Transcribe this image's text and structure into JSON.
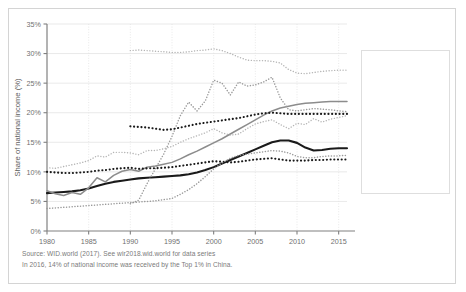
{
  "chart_data": {
    "type": "line",
    "title": "",
    "xlabel": "",
    "ylabel": "Share of national income (%)",
    "xlim": [
      1980,
      2016
    ],
    "ylim": [
      0,
      35
    ],
    "grid": true,
    "legend_position": "right",
    "xticks": [
      "1980",
      "1985",
      "1990",
      "1995",
      "2000",
      "2005",
      "2010",
      "2015"
    ],
    "xtick_values": [
      1980,
      1985,
      1990,
      1995,
      2000,
      2005,
      2010,
      2015
    ],
    "yticks": [
      "0%",
      "5%",
      "10%",
      "15%",
      "20%",
      "25%",
      "30%",
      "35%"
    ],
    "ytick_values": [
      0,
      5,
      10,
      15,
      20,
      25,
      30,
      35
    ],
    "series": [
      {
        "name": "China",
        "style": "solid",
        "color": "#1a1a1a",
        "width": 2.1,
        "x": [
          1980,
          1981,
          1982,
          1983,
          1984,
          1985,
          1986,
          1987,
          1988,
          1989,
          1990,
          1991,
          1992,
          1993,
          1994,
          1995,
          1996,
          1997,
          1998,
          1999,
          2000,
          2001,
          2002,
          2003,
          2004,
          2005,
          2006,
          2007,
          2008,
          2009,
          2010,
          2011,
          2012,
          2013,
          2014,
          2015,
          2016
        ],
        "values": [
          6.4,
          6.5,
          6.6,
          6.7,
          6.9,
          7.2,
          7.6,
          8.0,
          8.3,
          8.5,
          8.7,
          8.9,
          9.0,
          9.1,
          9.2,
          9.3,
          9.4,
          9.6,
          9.9,
          10.3,
          10.8,
          11.4,
          12.0,
          12.6,
          13.2,
          13.8,
          14.4,
          15.0,
          15.3,
          15.3,
          14.9,
          14.1,
          13.6,
          13.7,
          13.9,
          14.0,
          14.0
        ]
      },
      {
        "name": "India",
        "style": "solid",
        "color": "#8c8c8c",
        "width": 1.5,
        "x": [
          1980,
          1981,
          1982,
          1983,
          1984,
          1985,
          1986,
          1987,
          1988,
          1989,
          1990,
          1991,
          1992,
          1993,
          1994,
          1995,
          1996,
          1997,
          1998,
          1999,
          2000,
          2001,
          2002,
          2003,
          2004,
          2005,
          2006,
          2007,
          2008,
          2009,
          2010,
          2011,
          2012,
          2013,
          2014,
          2015,
          2016
        ],
        "values": [
          6.8,
          6.3,
          6.0,
          6.5,
          6.2,
          7.3,
          9.0,
          8.3,
          9.4,
          10.1,
          10.4,
          10.1,
          10.8,
          11.0,
          11.3,
          11.6,
          12.2,
          12.9,
          13.5,
          14.2,
          14.9,
          15.6,
          16.4,
          17.2,
          18.0,
          18.8,
          19.6,
          20.3,
          20.8,
          21.1,
          21.4,
          21.6,
          21.7,
          21.8,
          21.9,
          21.9,
          21.9
        ]
      },
      {
        "name": "Russia",
        "style": "dotted",
        "color": "#9a9a9a",
        "width": 1.5,
        "x": [
          1990,
          1991,
          1992,
          1993,
          1994,
          1995,
          1996,
          1997,
          1998,
          1999,
          2000,
          2001,
          2002,
          2003,
          2004,
          2005,
          2006,
          2007,
          2008,
          2009,
          2010,
          2011,
          2012,
          2013,
          2014,
          2015,
          2016
        ],
        "values": [
          4.6,
          5.2,
          8.0,
          10.5,
          13.0,
          16.0,
          19.5,
          21.8,
          20.3,
          22.0,
          25.5,
          25.0,
          23.0,
          25.2,
          24.5,
          24.7,
          25.2,
          26.0,
          22.5,
          20.5,
          20.3,
          20.5,
          20.7,
          20.6,
          20.5,
          20.3,
          20.2
        ]
      },
      {
        "name": "US-Canada",
        "style": "dotted",
        "color": "#b4b4b4",
        "width": 1.4,
        "x": [
          1980,
          1981,
          1982,
          1983,
          1984,
          1985,
          1986,
          1987,
          1988,
          1989,
          1990,
          1991,
          1992,
          1993,
          1994,
          1995,
          1996,
          1997,
          1998,
          1999,
          2000,
          2001,
          2002,
          2003,
          2004,
          2005,
          2006,
          2007,
          2008,
          2009,
          2010,
          2011,
          2012,
          2013,
          2014,
          2015,
          2016
        ],
        "values": [
          10.7,
          10.6,
          10.9,
          11.2,
          11.5,
          11.9,
          12.7,
          12.5,
          13.3,
          13.3,
          13.2,
          12.9,
          13.6,
          13.6,
          13.9,
          14.3,
          15.0,
          15.6,
          16.1,
          16.6,
          17.3,
          16.6,
          16.2,
          16.4,
          17.3,
          18.1,
          18.5,
          18.8,
          18.0,
          17.3,
          18.2,
          18.0,
          19.0,
          18.4,
          18.9,
          19.2,
          19.5
        ]
      },
      {
        "name": "Europe",
        "style": "dotted-bold",
        "color": "#1a1a1a",
        "width": 2.1,
        "x": [
          1980,
          1981,
          1982,
          1983,
          1984,
          1985,
          1986,
          1987,
          1988,
          1989,
          1990,
          1991,
          1992,
          1993,
          1994,
          1995,
          1996,
          1997,
          1998,
          1999,
          2000,
          2001,
          2002,
          2003,
          2004,
          2005,
          2006,
          2007,
          2008,
          2009,
          2010,
          2011,
          2012,
          2013,
          2014,
          2015,
          2016
        ],
        "values": [
          10.0,
          9.9,
          9.8,
          9.8,
          9.9,
          10.0,
          10.2,
          10.3,
          10.5,
          10.6,
          10.7,
          10.5,
          10.6,
          10.6,
          10.7,
          10.8,
          11.0,
          11.2,
          11.4,
          11.6,
          11.8,
          11.7,
          11.6,
          11.7,
          11.9,
          12.1,
          12.2,
          12.3,
          12.1,
          11.9,
          11.9,
          11.9,
          12.0,
          12.0,
          12.1,
          12.1,
          12.1
        ]
      },
      {
        "name": "Middle East",
        "style": "dotted",
        "color": "#b4b4b4",
        "width": 1.4,
        "x": [
          1990,
          1991,
          1992,
          1993,
          1994,
          1995,
          1996,
          1997,
          1998,
          1999,
          2000,
          2001,
          2002,
          2003,
          2004,
          2005,
          2006,
          2007,
          2008,
          2009,
          2010,
          2011,
          2012,
          2013,
          2014,
          2015,
          2016
        ],
        "values": [
          30.5,
          30.6,
          30.5,
          30.4,
          30.3,
          30.2,
          30.2,
          30.3,
          30.5,
          30.6,
          30.8,
          30.5,
          30.0,
          29.4,
          28.9,
          28.8,
          28.8,
          28.7,
          28.4,
          27.3,
          26.7,
          26.6,
          26.8,
          27.0,
          27.1,
          27.2,
          27.2
        ]
      },
      {
        "name": "Sub-Saharan Africa",
        "style": "dotted-bold",
        "color": "#1a1a1a",
        "width": 2.1,
        "x": [
          1990,
          1991,
          1992,
          1993,
          1994,
          1995,
          1996,
          1997,
          1998,
          1999,
          2000,
          2001,
          2002,
          2003,
          2004,
          2005,
          2006,
          2007,
          2008,
          2009,
          2010,
          2011,
          2012,
          2013,
          2014,
          2015,
          2016
        ],
        "values": [
          17.7,
          17.6,
          17.5,
          17.3,
          17.1,
          17.2,
          17.5,
          17.8,
          18.1,
          18.3,
          18.5,
          18.7,
          18.9,
          19.1,
          19.4,
          19.7,
          19.9,
          20.0,
          19.9,
          19.8,
          19.8,
          19.8,
          19.8,
          19.8,
          19.8,
          19.8,
          19.8
        ]
      },
      {
        "name": "Brazil",
        "style": "dotted",
        "color": "#9a9a9a",
        "width": 1.5,
        "x": [
          1980,
          1981,
          1982,
          1983,
          1984,
          1985,
          1986,
          1987,
          1988,
          1989,
          1990,
          1991,
          1992,
          1993,
          1994,
          1995,
          1996,
          1997,
          1998,
          1999,
          2000,
          2001,
          2002,
          2003,
          2004,
          2005,
          2006,
          2007,
          2008,
          2009,
          2010,
          2011,
          2012,
          2013,
          2014,
          2015,
          2016
        ],
        "values": [
          3.8,
          3.9,
          4.0,
          4.1,
          4.2,
          4.3,
          4.4,
          4.5,
          4.6,
          4.7,
          4.8,
          4.9,
          5.0,
          5.1,
          5.3,
          5.5,
          6.2,
          7.0,
          8.0,
          9.2,
          10.5,
          11.5,
          12.3,
          12.8,
          13.0,
          13.2,
          13.4,
          13.6,
          13.5,
          13.2,
          12.6,
          12.4,
          12.4,
          12.6,
          12.7,
          12.7,
          12.8
        ]
      }
    ],
    "source_line1": "Source: WID.world (2017). See wir2018.wid.world for data series",
    "source_line2": "In 2016, 14% of national income was received by the Top 1% in China."
  },
  "legend": {
    "items": [
      {
        "label": "China"
      },
      {
        "label": "India"
      },
      {
        "label": "Russia"
      },
      {
        "label": "US-Canada"
      },
      {
        "label": "Europe"
      },
      {
        "label": "Middle East"
      },
      {
        "label": "Sub-Saharan"
      },
      {
        "label": "Africa"
      },
      {
        "label": "Brazil"
      }
    ]
  },
  "colors": {
    "frame_border": "#d4d4d4",
    "grid": "#e3e3e3",
    "axis": "#808080",
    "text": "#6f6f6f",
    "background": "#ffffff"
  }
}
